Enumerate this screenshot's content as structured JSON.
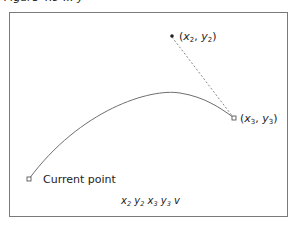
{
  "caption_clipped": "Figure 4.9 ... y",
  "diagram": {
    "points": {
      "current_point": {
        "label": "Current point",
        "x": 29,
        "y": 179,
        "marker": "open-square"
      },
      "control": {
        "label_var": "x",
        "sub": "2",
        "label_var2": "y",
        "sub2": "2",
        "x": 172,
        "y": 36,
        "marker": "filled-dot"
      },
      "end": {
        "label_var": "x",
        "sub": "3",
        "label_var2": "y",
        "sub2": "3",
        "x": 234,
        "y": 118,
        "marker": "open-square"
      }
    },
    "operator_line": {
      "tokens": [
        {
          "v": "x",
          "s": "2"
        },
        {
          "v": "y",
          "s": "2"
        },
        {
          "v": "x",
          "s": "3"
        },
        {
          "v": "y",
          "s": "3"
        }
      ],
      "op": "v"
    },
    "colors": {
      "frame": "#7a7a7a",
      "curve": "#6e6e6e",
      "dashed": "#8a8a8a",
      "text": "#222222"
    }
  }
}
